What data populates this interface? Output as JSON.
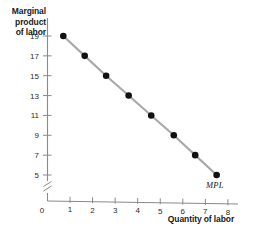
{
  "chart_data": {
    "type": "line",
    "title": "",
    "xlabel": "Quantity of labor",
    "ylabel": "Marginal product of labor",
    "ylabel_lines": [
      "Marginal",
      "product",
      "of labor"
    ],
    "x": [
      0.7,
      1.65,
      2.6,
      3.6,
      4.6,
      5.6,
      6.55,
      7.5
    ],
    "values": [
      19,
      17,
      15,
      13,
      11,
      9,
      7,
      5
    ],
    "series": [
      {
        "name": "MPL",
        "x": [
          0.7,
          1.65,
          2.6,
          3.6,
          4.6,
          5.6,
          6.55,
          7.5
        ],
        "values": [
          19,
          17,
          15,
          13,
          11,
          9,
          7,
          5
        ]
      }
    ],
    "xticks": [
      0,
      1,
      2,
      3,
      4,
      5,
      6,
      7,
      8
    ],
    "xtick_labels": [
      "0",
      "1",
      "2",
      "3",
      "4",
      "5",
      "6",
      "7",
      "8"
    ],
    "yticks": [
      5,
      7,
      9,
      11,
      13,
      15,
      17,
      19
    ],
    "ytick_labels": [
      "5",
      "7",
      "9",
      "11",
      "13",
      "15",
      "17",
      "19"
    ],
    "y_origin_label": "0",
    "y_axis_break": true,
    "xlim": [
      0,
      8.6
    ],
    "ylim": [
      5,
      19
    ],
    "grid": false,
    "legend": "none",
    "annotations": [
      {
        "text": "MPL",
        "x": 7.5,
        "y": 5,
        "position": "below-right"
      }
    ],
    "colors": {
      "line": "#a8a8a8",
      "marker": "#111111",
      "axis": "#8a8a8a",
      "text": "#1a1a1a",
      "background": "#ffffff"
    }
  }
}
